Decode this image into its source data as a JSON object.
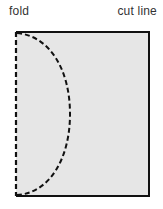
{
  "labels": {
    "left": "fold",
    "right": "cut line"
  },
  "colors": {
    "paper_fill": "#e6e6e6",
    "outline": "#111111",
    "dash": "#111111",
    "text": "#333333"
  }
}
